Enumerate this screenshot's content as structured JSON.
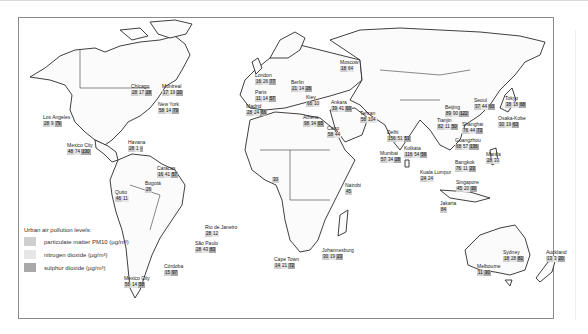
{
  "map": {
    "title": "Urban air pollution levels",
    "legend": {
      "title": "Urban air pollution levels:",
      "items": [
        {
          "label": "particulate matter PM10 (µg/m³)",
          "color": "#cfcfcf"
        },
        {
          "label": "nitrogen dioxide (µg/m³)",
          "color": "#e6e6e6"
        },
        {
          "label": "sulphur dioxide (µg/m³)",
          "color": "#a9a9a9"
        }
      ]
    },
    "cities": [
      {
        "name": "Chicago",
        "values": [
          "28",
          "17",
          "28"
        ]
      },
      {
        "name": "Montreal",
        "values": [
          "17",
          "19",
          "20"
        ]
      },
      {
        "name": "New York",
        "values": [
          "58",
          "14",
          "79"
        ]
      },
      {
        "name": "Los Angeles",
        "values": [
          "28",
          "9",
          "79"
        ]
      },
      {
        "name": "Mexico City",
        "values": [
          "48",
          "74",
          "130"
        ]
      },
      {
        "name": "Havana",
        "values": [
          "28",
          "1",
          "-"
        ]
      },
      {
        "name": "Caracas",
        "values": [
          "16",
          "41",
          "57"
        ]
      },
      {
        "name": "Bogotá",
        "values": [
          "26"
        ]
      },
      {
        "name": "Quito",
        "values": [
          "46",
          "11"
        ]
      },
      {
        "name": "Rio de Janeiro",
        "values": [
          "28",
          "12"
        ]
      },
      {
        "name": "São Paulo",
        "values": [
          "28",
          "43",
          "83"
        ]
      },
      {
        "name": "Córdoba",
        "values": [
          "15",
          "97"
        ]
      },
      {
        "name": "Mexico City (Santiago)",
        "values": [
          "56",
          "14",
          "58"
        ]
      },
      {
        "name": "London",
        "values": [
          "16",
          "26",
          "77"
        ]
      },
      {
        "name": "Paris",
        "values": [
          "11",
          "14",
          "57"
        ]
      },
      {
        "name": "Madrid",
        "values": [
          "28",
          "24",
          "66"
        ]
      },
      {
        "name": "Berlin",
        "values": [
          "21",
          "14",
          "26"
        ]
      },
      {
        "name": "Moscow",
        "values": [
          "18",
          "64"
        ]
      },
      {
        "name": "Kiev",
        "values": [
          "66",
          "10"
        ]
      },
      {
        "name": "Ankara",
        "values": [
          "39",
          "41",
          "93"
        ]
      },
      {
        "name": "Athens",
        "values": [
          "98",
          "34",
          "65"
        ]
      },
      {
        "name": "Cairo",
        "values": [
          "58",
          "44"
        ]
      },
      {
        "name": "Tehran",
        "values": [
          "58",
          "104"
        ]
      },
      {
        "name": "Delhi",
        "values": [
          "156",
          "51",
          "53"
        ]
      },
      {
        "name": "Mumbai",
        "values": [
          "57",
          "34",
          "28"
        ]
      },
      {
        "name": "Kolkata",
        "values": [
          "116",
          "54",
          "56"
        ]
      },
      {
        "name": "Beijing",
        "values": [
          "89",
          "90",
          "122"
        ]
      },
      {
        "name": "Tianjin",
        "values": [
          "82",
          "11",
          "50"
        ]
      },
      {
        "name": "Seoul",
        "values": [
          "37",
          "44",
          "60"
        ]
      },
      {
        "name": "Shanghai",
        "values": [
          "76",
          "44",
          "73"
        ]
      },
      {
        "name": "Tokyo",
        "values": [
          "38",
          "18",
          "68"
        ]
      },
      {
        "name": "Osaka-Kobe",
        "values": [
          "30",
          "19",
          "63"
        ]
      },
      {
        "name": "Guangzhou",
        "values": [
          "68",
          "57",
          "136"
        ]
      },
      {
        "name": "Bangkok",
        "values": [
          "76",
          "11",
          "23"
        ]
      },
      {
        "name": "Manila",
        "values": [
          "28",
          "33"
        ]
      },
      {
        "name": "Kuala Lumpur",
        "values": [
          "24",
          "24"
        ]
      },
      {
        "name": "Singapore",
        "values": [
          "45",
          "20",
          "30"
        ]
      },
      {
        "name": "Jakarta",
        "values": [
          "84"
        ]
      },
      {
        "name": "Nairobi",
        "values": [
          "45"
        ]
      },
      {
        "name": "Lagos",
        "values": [
          "30"
        ]
      },
      {
        "name": "Cape Town",
        "values": [
          "14",
          "21",
          "72"
        ]
      },
      {
        "name": "Johannesburg",
        "values": [
          "30",
          "19",
          "23"
        ]
      },
      {
        "name": "Sydney",
        "values": [
          "18",
          "28",
          "81"
        ]
      },
      {
        "name": "Melbourne",
        "values": [
          "11",
          "30"
        ]
      },
      {
        "name": "Auckland",
        "values": [
          "13",
          "3",
          "20"
        ]
      }
    ]
  }
}
